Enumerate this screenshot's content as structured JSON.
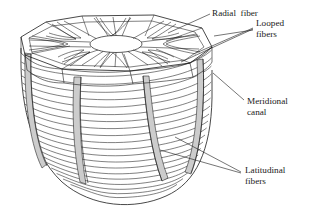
{
  "figure": {
    "background_color": "#ffffff",
    "line_color": "#1a1a1a",
    "canal_fill_color": "#cccccc",
    "text_color": "#1a1a1a"
  },
  "labels": [
    {
      "id": "radial-fiber",
      "text": "Radial  fiber",
      "lines": [
        "Radial  fiber"
      ],
      "x": 213,
      "y": 13
    },
    {
      "id": "looped-fibers",
      "text": "Looped fibers",
      "lines": [
        "Looped",
        "fibers"
      ],
      "x": 256,
      "y": 28
    },
    {
      "id": "meridional-canal",
      "text": "Meridional canal",
      "lines": [
        "Meridional",
        "canal"
      ],
      "x": 247,
      "y": 104
    },
    {
      "id": "latitudinal-fibers",
      "text": "Latitudinal fibers",
      "lines": [
        "Latitudinal",
        "fibers"
      ],
      "x": 243,
      "y": 172
    }
  ],
  "structure": {
    "shape": "bowl",
    "top_disc_sides": 8,
    "central_oval_label": "central-oval",
    "radial_fiber_count": 16,
    "looped_fiber_chamber_count": 8,
    "meridional_canal_count": 4,
    "latitudinal_ring_count": 20
  }
}
